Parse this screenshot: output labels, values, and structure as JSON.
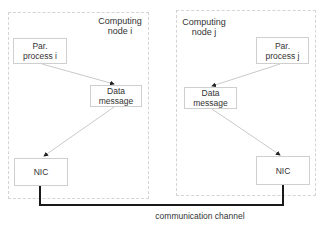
{
  "nodes": {
    "left": {
      "label": "Computing\nnode i",
      "process": "Par.\nprocess i",
      "message": "Data\nmessage",
      "nic": "NIC"
    },
    "right": {
      "label": "Computing\nnode j",
      "process": "Par.\nprocess j",
      "message": "Data\nmessage",
      "nic": "NIC"
    }
  },
  "channel": {
    "label": "communication channel"
  }
}
